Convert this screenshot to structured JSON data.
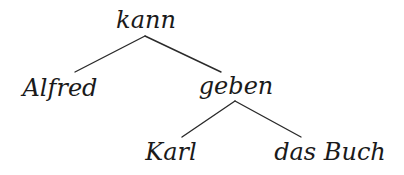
{
  "diagram": {
    "type": "dependency-tree",
    "colors": {
      "text": "#1a1a1a",
      "edge": "#2a2a2a",
      "background": "#ffffff"
    },
    "nodes": {
      "root": {
        "label": "kann"
      },
      "left_child": {
        "label": "Alfred"
      },
      "right_child": {
        "label": "geben"
      },
      "right_left_child": {
        "label": "Karl"
      },
      "right_right_child": {
        "label": "das Buch"
      }
    },
    "edges": [
      {
        "from": "kann",
        "to": "Alfred"
      },
      {
        "from": "kann",
        "to": "geben"
      },
      {
        "from": "geben",
        "to": "Karl"
      },
      {
        "from": "geben",
        "to": "das Buch"
      }
    ]
  }
}
